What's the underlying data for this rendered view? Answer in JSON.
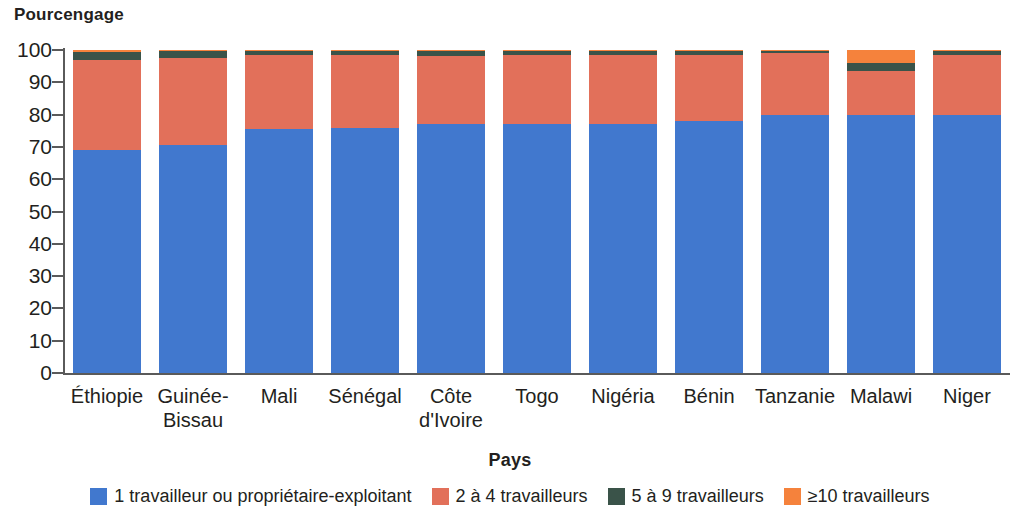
{
  "chart_data": {
    "type": "bar",
    "stacked": true,
    "title": "",
    "ylabel": "Pourcengage",
    "xlabel": "Pays",
    "ylim": [
      0,
      100
    ],
    "ytick_labels": [
      "0",
      "10",
      "20",
      "30",
      "40",
      "50",
      "60",
      "70",
      "80",
      "90",
      "100"
    ],
    "ytick_values": [
      0,
      10,
      20,
      30,
      40,
      50,
      60,
      70,
      80,
      90,
      100
    ],
    "grid": false,
    "legend_position": "bottom",
    "categories": [
      "Éthiopie",
      "Guinée-\nBissau",
      "Mali",
      "Sénégal",
      "Côte\nd'Ivoire",
      "Togo",
      "Nigéria",
      "Bénin",
      "Tanzanie",
      "Malawi",
      "Niger"
    ],
    "series": [
      {
        "name": "1 travailleur ou propriétaire-exploitant",
        "color": "#4178CE",
        "values": [
          69,
          70.5,
          75.5,
          76,
          77,
          77,
          77,
          78,
          80,
          80,
          80
        ]
      },
      {
        "name": "2 à 4 travailleurs",
        "color": "#E2705A",
        "values": [
          28,
          27,
          23,
          22.5,
          21,
          21.5,
          21.5,
          20.5,
          19,
          13.5,
          18.5
        ]
      },
      {
        "name": "5 à 9 travailleurs",
        "color": "#3A5349",
        "values": [
          2.4,
          2.2,
          1.2,
          1.3,
          1.7,
          1.3,
          1.2,
          1.3,
          0.9,
          2.5,
          1.3
        ]
      },
      {
        "name": "≥10 travailleurs",
        "color": "#F5823C",
        "values": [
          0.6,
          0.3,
          0.3,
          0.2,
          0.3,
          0.2,
          0.3,
          0.2,
          0.1,
          4.0,
          0.2
        ]
      }
    ]
  },
  "axis": {
    "line_color": "#5a5a5a"
  }
}
